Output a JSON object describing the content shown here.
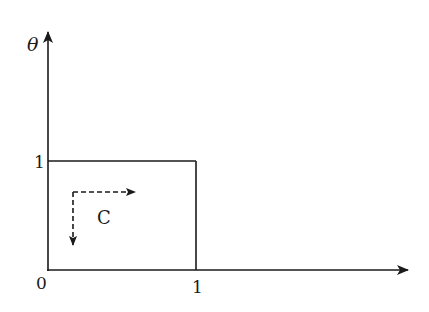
{
  "diagram": {
    "axes": {
      "y_label": "θ",
      "x_label": "",
      "origin_label": "0",
      "y_tick_label": "1",
      "x_tick_label": "1"
    },
    "region": {
      "shape": "unit square",
      "x_range": [
        0,
        1
      ],
      "y_range": [
        0,
        1
      ]
    },
    "contour": {
      "label": "C",
      "style": "dashed",
      "directions": [
        "right",
        "down"
      ]
    },
    "colors": {
      "stroke": "#1a1a1a",
      "background": "#ffffff"
    }
  }
}
